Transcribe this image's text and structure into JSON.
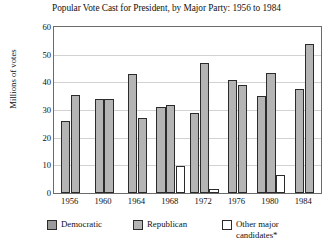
{
  "chart_data": {
    "type": "bar",
    "title": "Popular Vote Cast for President, by Major Party: 1956 to 1984",
    "xlabel": "",
    "ylabel": "Millions of votes",
    "ylim": [
      0,
      60
    ],
    "ytick_step": 10,
    "yticks": [
      "0",
      "10",
      "20",
      "30",
      "40",
      "50",
      "60"
    ],
    "grid": true,
    "legend_position": "bottom",
    "categories": [
      "1956",
      "1960",
      "1964",
      "1968",
      "1972",
      "1976",
      "1980",
      "1984"
    ],
    "series": [
      {
        "name": "Democratic",
        "color": "#b4b4b4",
        "values": [
          26,
          34,
          43,
          31,
          29,
          41,
          35,
          37.5
        ]
      },
      {
        "name": "Republican",
        "color": "#b4b4b4",
        "values": [
          35.5,
          34,
          27.2,
          31.8,
          47,
          39,
          43.5,
          54
        ]
      },
      {
        "name": "Other major candidates*",
        "color": "#ffffff",
        "values": [
          0,
          0,
          0,
          9.9,
          1.4,
          0,
          6.5,
          0
        ]
      }
    ]
  },
  "legend": {
    "items": [
      {
        "label": "Democratic",
        "swatch": "democratic"
      },
      {
        "label": "Republican",
        "swatch": "republican"
      },
      {
        "label": "Other major candidates*",
        "swatch": "other"
      }
    ]
  }
}
